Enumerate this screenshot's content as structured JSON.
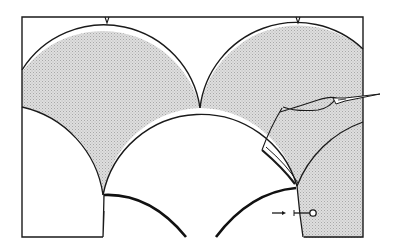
{
  "figure": {
    "title": "Clamshell patchwork piecing diagram",
    "colors": {
      "background": "#ffffff",
      "line": "#1a1a1a",
      "shaded_fill": "#d4d4d4",
      "shade_pattern": "#bdbdbd"
    },
    "elements": {
      "frame": "rectangular-base-fabric",
      "shells": [
        "upper-left-shaded-shell",
        "upper-right-shaded-shell",
        "middle-white-shell",
        "lower-right-shaded-shell"
      ],
      "tools": [
        "needle-with-thread",
        "pin"
      ],
      "markers": [
        "center-notch-left",
        "center-notch-right",
        "arrow-pointer"
      ]
    }
  }
}
